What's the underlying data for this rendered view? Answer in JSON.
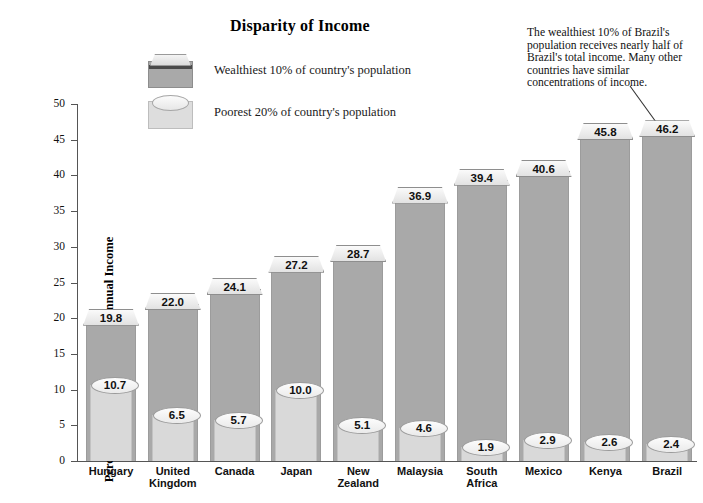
{
  "chart_data": {
    "type": "bar",
    "title": "Disparity of Income",
    "xlabel": "",
    "ylabel": "Percentage of Country's Total Annual Income",
    "ylim": [
      0,
      50
    ],
    "yticks": [
      0,
      5,
      10,
      15,
      20,
      25,
      30,
      35,
      40,
      45,
      50
    ],
    "grid": false,
    "legend_position": "top-center",
    "categories": [
      "Hungary",
      "United Kingdom",
      "Canada",
      "Japan",
      "New Zealand",
      "Malaysia",
      "South Africa",
      "Mexico",
      "Kenya",
      "Brazil"
    ],
    "series": [
      {
        "name": "Wealthiest 10% of country's population",
        "values": [
          19.8,
          22.0,
          24.1,
          27.2,
          28.7,
          36.9,
          39.4,
          40.6,
          45.8,
          46.2
        ],
        "color": "#a9a9a9"
      },
      {
        "name": "Poorest 20% of country's population",
        "values": [
          10.7,
          6.5,
          5.7,
          10.0,
          5.1,
          4.6,
          1.9,
          2.9,
          2.6,
          2.4
        ],
        "color": "#d9d9d9"
      }
    ],
    "annotations": [
      {
        "text": "The wealthiest 10% of Brazil's population receives nearly half of Brazil's total income.  Many other countries have similar concentrations of income.",
        "points_to": "Brazil"
      }
    ]
  },
  "legend": {
    "items": [
      {
        "label": "Wealthiest 10% of country's population",
        "swatch": "dark-box-swatch"
      },
      {
        "label": "Poorest 20% of country's population",
        "swatch": "light-cylinder-swatch"
      }
    ]
  },
  "x_labels": [
    [
      "Hungary"
    ],
    [
      "United",
      "Kingdom"
    ],
    [
      "Canada"
    ],
    [
      "Japan"
    ],
    [
      "New",
      "Zealand"
    ],
    [
      "Malaysia"
    ],
    [
      "South",
      "Africa"
    ],
    [
      "Mexico"
    ],
    [
      "Kenya"
    ],
    [
      "Brazil"
    ]
  ],
  "top_value_labels": [
    "19.8",
    "22.0",
    "24.1",
    "27.2",
    "28.7",
    "36.9",
    "39.4",
    "40.6",
    "45.8",
    "46.2"
  ],
  "bottom_value_labels": [
    "10.7",
    "6.5",
    "5.7",
    "10.0",
    "5.1",
    "4.6",
    "1.9",
    "2.9",
    "2.6",
    "2.4"
  ],
  "y_tick_labels": [
    "0",
    "5",
    "10",
    "15",
    "20",
    "25",
    "30",
    "35",
    "40",
    "45",
    "50"
  ],
  "colors": {
    "wealthiest_bar": "#a9a9a9",
    "poorest_bar": "#d9d9d9",
    "bar_top_edge": "#3c3c3c",
    "axis": "#555555",
    "text": "#111111"
  }
}
